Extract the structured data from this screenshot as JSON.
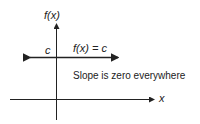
{
  "diagram": {
    "y_axis_label": "f(x)",
    "x_axis_label": "x",
    "constant_label": "c",
    "function_label": "f(x) = c",
    "annotation": "Slope is zero everywhere"
  },
  "colors": {
    "line": "#222222",
    "background": "#ffffff"
  }
}
